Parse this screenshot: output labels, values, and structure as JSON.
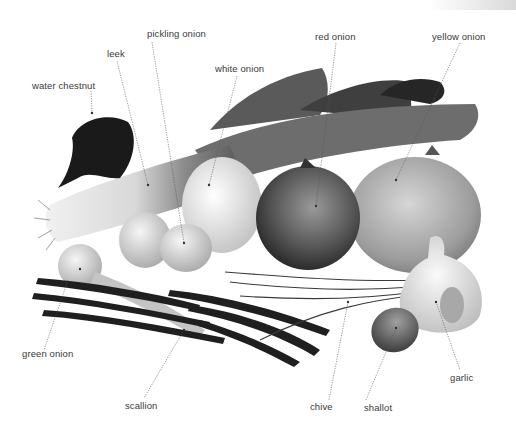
{
  "diagram": {
    "colors": {
      "background": "#ffffff",
      "label_text": "#3a3a3a",
      "leader_line": "#555555"
    },
    "labels": [
      {
        "id": "water-chestnut",
        "text": "water chestnut",
        "x": 32,
        "y": 80
      },
      {
        "id": "leek",
        "text": "leek",
        "x": 107,
        "y": 48
      },
      {
        "id": "pickling-onion",
        "text": "pickling onion",
        "x": 147,
        "y": 28
      },
      {
        "id": "white-onion",
        "text": "white onion",
        "x": 215,
        "y": 63
      },
      {
        "id": "red-onion",
        "text": "red onion",
        "x": 315,
        "y": 31
      },
      {
        "id": "yellow-onion",
        "text": "yellow onion",
        "x": 432,
        "y": 31
      },
      {
        "id": "green-onion",
        "text": "green onion",
        "x": 22,
        "y": 348
      },
      {
        "id": "scallion",
        "text": "scallion",
        "x": 125,
        "y": 400
      },
      {
        "id": "chive",
        "text": "chive",
        "x": 310,
        "y": 401
      },
      {
        "id": "shallot",
        "text": "shallot",
        "x": 364,
        "y": 402
      },
      {
        "id": "garlic",
        "text": "garlic",
        "x": 450,
        "y": 372
      }
    ]
  }
}
